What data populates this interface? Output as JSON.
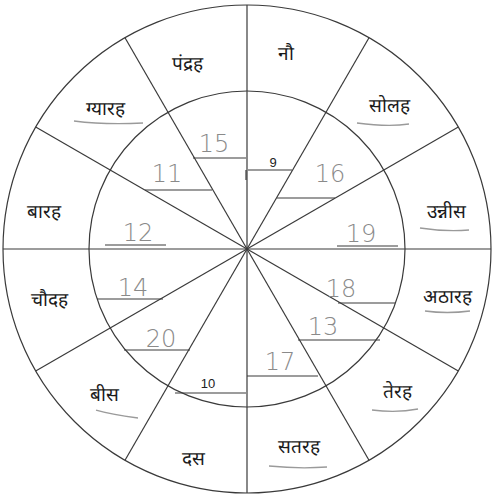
{
  "diagram": {
    "title": "",
    "center": [
      247,
      249
    ],
    "outer_radius": 244,
    "inner_radius": 158,
    "segments": 12,
    "colors": {
      "lines": "#3a3a3a",
      "printed_text": "#1a1a1a",
      "handwriting": "#8a8a8a"
    }
  },
  "outer_words": [
    {
      "id": "nau",
      "text": "नौ",
      "x": 286,
      "y": 60
    },
    {
      "id": "solah",
      "text": "सोलह",
      "x": 389,
      "y": 112
    },
    {
      "id": "unnees",
      "text": "उन्नीस",
      "x": 446,
      "y": 218
    },
    {
      "id": "athaarah",
      "text": "अठारह",
      "x": 447,
      "y": 303
    },
    {
      "id": "terah",
      "text": "तेरह",
      "x": 397,
      "y": 398
    },
    {
      "id": "satarah",
      "text": "सतरह",
      "x": 299,
      "y": 453
    },
    {
      "id": "das",
      "text": "दस",
      "x": 193,
      "y": 465
    },
    {
      "id": "bees",
      "text": "बीस",
      "x": 104,
      "y": 401
    },
    {
      "id": "chaudah",
      "text": "चौदह",
      "x": 49,
      "y": 306
    },
    {
      "id": "baarah",
      "text": "बारह",
      "x": 44,
      "y": 218
    },
    {
      "id": "gyaarah",
      "text": "ग्यारह",
      "x": 105,
      "y": 115
    },
    {
      "id": "pandrah",
      "text": "पंद्रह",
      "x": 187,
      "y": 70
    }
  ],
  "inner_numbers": [
    {
      "id": "n15",
      "text": "15",
      "style": "hand",
      "x": 214,
      "y": 152,
      "line": [
        193,
        158,
        246,
        158
      ]
    },
    {
      "id": "n9",
      "text": "9",
      "style": "print",
      "x": 273,
      "y": 167,
      "line": [
        248,
        170,
        292,
        170
      ]
    },
    {
      "id": "n11",
      "text": "11",
      "style": "hand",
      "x": 167,
      "y": 182,
      "line": [
        145,
        190,
        212,
        190
      ]
    },
    {
      "id": "n16",
      "text": "16",
      "style": "hand",
      "x": 330,
      "y": 182,
      "line": [
        277,
        198,
        335,
        198
      ]
    },
    {
      "id": "n12",
      "text": "12",
      "style": "hand",
      "x": 138,
      "y": 241,
      "line": [
        105,
        245,
        166,
        245
      ]
    },
    {
      "id": "n19",
      "text": "19",
      "style": "hand",
      "x": 361,
      "y": 242,
      "line": [
        337,
        246,
        398,
        246
      ]
    },
    {
      "id": "n14",
      "text": "14",
      "style": "hand",
      "x": 133,
      "y": 296,
      "line": [
        97,
        299,
        163,
        299
      ]
    },
    {
      "id": "n18",
      "text": "18",
      "style": "hand",
      "x": 341,
      "y": 297,
      "line": [
        338,
        303,
        395,
        303
      ]
    },
    {
      "id": "n20",
      "text": "20",
      "style": "hand",
      "x": 161,
      "y": 347,
      "line": [
        124,
        350,
        190,
        350
      ]
    },
    {
      "id": "n13",
      "text": "13",
      "style": "hand",
      "x": 323,
      "y": 335,
      "line": [
        298,
        340,
        380,
        340
      ]
    },
    {
      "id": "n10",
      "text": "10",
      "style": "print",
      "x": 208,
      "y": 388,
      "line": [
        175,
        393,
        246,
        393
      ]
    },
    {
      "id": "n17",
      "text": "17",
      "style": "hand",
      "x": 280,
      "y": 370,
      "line": [
        247,
        376,
        318,
        376
      ]
    }
  ]
}
